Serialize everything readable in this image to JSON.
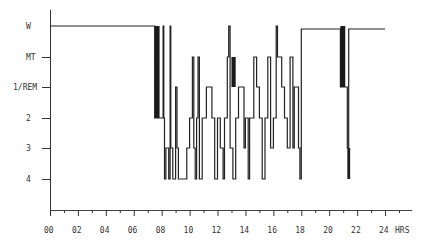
{
  "chart_data": {
    "type": "line",
    "subtype": "hypnogram (step)",
    "title": "",
    "xlabel": "HRS",
    "ylabel": "",
    "xlim": [
      0,
      24
    ],
    "x_ticks": [
      "00",
      "02",
      "04",
      "06",
      "08",
      "10",
      "12",
      "14",
      "16",
      "18",
      "20",
      "22",
      "24"
    ],
    "x_minor_tick_step_hours": 1,
    "y_categories": [
      "W",
      "MT",
      "1/REM",
      "2",
      "3",
      "4"
    ],
    "grid": false,
    "legend": null,
    "series": [
      {
        "name": "sleep stage",
        "points": [
          [
            0.0,
            "W"
          ],
          [
            7.5,
            "W"
          ],
          [
            7.5,
            "2"
          ],
          [
            8.1,
            "2"
          ],
          [
            8.1,
            "W"
          ],
          [
            8.15,
            "2"
          ],
          [
            8.2,
            "4"
          ],
          [
            8.3,
            "3"
          ],
          [
            8.5,
            "4"
          ],
          [
            8.6,
            "W"
          ],
          [
            8.65,
            "3"
          ],
          [
            8.8,
            "4"
          ],
          [
            9.0,
            "1/REM"
          ],
          [
            9.1,
            "3"
          ],
          [
            9.2,
            "4"
          ],
          [
            9.8,
            "4"
          ],
          [
            9.8,
            "3"
          ],
          [
            10.0,
            "2"
          ],
          [
            10.2,
            "MT"
          ],
          [
            10.3,
            "3"
          ],
          [
            10.4,
            "4"
          ],
          [
            10.5,
            "2"
          ],
          [
            10.6,
            "MT"
          ],
          [
            10.7,
            "4"
          ],
          [
            10.9,
            "2"
          ],
          [
            11.2,
            "1/REM"
          ],
          [
            11.5,
            "1/REM"
          ],
          [
            11.6,
            "2"
          ],
          [
            11.8,
            "4"
          ],
          [
            12.0,
            "2"
          ],
          [
            12.2,
            "3"
          ],
          [
            12.4,
            "4"
          ],
          [
            12.5,
            "2"
          ],
          [
            12.7,
            "MT"
          ],
          [
            12.8,
            "W"
          ],
          [
            12.9,
            "3"
          ],
          [
            13.1,
            "4"
          ],
          [
            13.3,
            "2"
          ],
          [
            13.5,
            "1/REM"
          ],
          [
            13.8,
            "1/REM"
          ],
          [
            13.9,
            "3"
          ],
          [
            14.0,
            "2"
          ],
          [
            14.2,
            "4"
          ],
          [
            14.3,
            "2"
          ],
          [
            14.6,
            "MT"
          ],
          [
            14.8,
            "1/REM"
          ],
          [
            15.0,
            "2"
          ],
          [
            15.2,
            "4"
          ],
          [
            15.4,
            "2"
          ],
          [
            15.6,
            "MT"
          ],
          [
            15.8,
            "3"
          ],
          [
            16.0,
            "2"
          ],
          [
            16.2,
            "W"
          ],
          [
            16.3,
            "MT"
          ],
          [
            16.6,
            "1/REM"
          ],
          [
            16.8,
            "2"
          ],
          [
            17.0,
            "3"
          ],
          [
            17.2,
            "MT"
          ],
          [
            17.4,
            "3"
          ],
          [
            17.5,
            "1/REM"
          ],
          [
            17.7,
            "1/REM"
          ],
          [
            17.8,
            "3"
          ],
          [
            17.9,
            "4"
          ],
          [
            18.0,
            "W"
          ],
          [
            18.0,
            "W"
          ],
          [
            20.8,
            "W"
          ],
          [
            20.8,
            "1/REM"
          ],
          [
            21.2,
            "1/REM"
          ],
          [
            21.3,
            "3"
          ],
          [
            21.4,
            "4"
          ],
          [
            21.4,
            "W"
          ],
          [
            24.0,
            "W"
          ]
        ]
      }
    ]
  },
  "axis": {
    "x_label": "HRS",
    "x_ticks": [
      "00",
      "02",
      "04",
      "06",
      "08",
      "10",
      "12",
      "14",
      "16",
      "18",
      "20",
      "22",
      "24"
    ],
    "y_labels": [
      "W",
      "MT",
      "1/REM",
      "2",
      "3",
      "4"
    ]
  }
}
